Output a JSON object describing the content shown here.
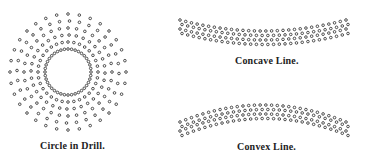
{
  "figures": [
    {
      "id": "circle",
      "caption": "Circle in Drill.",
      "center": [
        68,
        72
      ],
      "inner_ring": {
        "radius": 23,
        "dots": 40
      },
      "rings": [
        30,
        37,
        44,
        51,
        58
      ],
      "spokes": 32
    },
    {
      "id": "concave",
      "caption": "Concave Line.",
      "x_start": 180,
      "x_end": 346,
      "rows": 4,
      "cols": 30,
      "y_ends": 20,
      "y_mid": 31,
      "row_gap": 4.5
    },
    {
      "id": "convex",
      "caption": "Convex Line.",
      "x_start": 180,
      "x_end": 346,
      "rows": 4,
      "cols": 30,
      "y_ends": 122,
      "y_mid": 105,
      "row_gap": 4.5
    }
  ],
  "colors": {
    "dot": "#3a3a3a",
    "background": "#ffffff"
  }
}
